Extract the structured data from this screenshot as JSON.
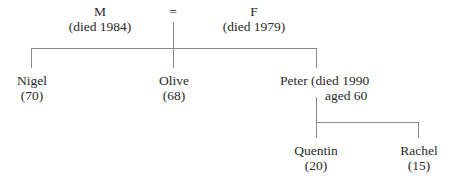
{
  "diagram": {
    "type": "family-tree",
    "parents": {
      "father": {
        "name": "M",
        "note": "(died 1984)"
      },
      "marriage_symbol": "=",
      "mother": {
        "name": "F",
        "note": "(died 1979)"
      }
    },
    "children": [
      {
        "name": "Nigel",
        "note": "(70)"
      },
      {
        "name": "Olive",
        "note": "(68)"
      },
      {
        "name": "Peter (died 1990",
        "note": "aged 60"
      }
    ],
    "grandchildren": [
      {
        "name": "Quentin",
        "note": "(20)"
      },
      {
        "name": "Rachel",
        "note": "(15)"
      }
    ],
    "line_color": "#8a8a8a"
  }
}
